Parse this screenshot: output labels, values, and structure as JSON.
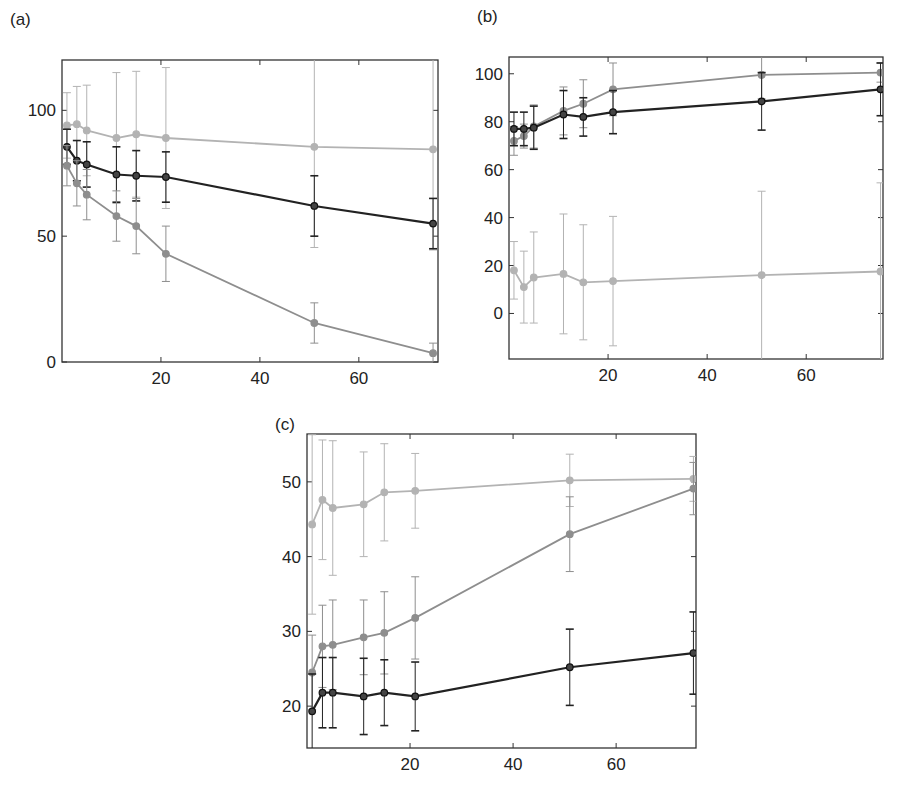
{
  "figure": {
    "panels": [
      "(a)",
      "(b)",
      "(c)"
    ]
  },
  "colors": {
    "light": "#b3b3b3",
    "medium": "#8e8e8e",
    "dark": "#222222",
    "axis": "#333333"
  },
  "chart_data": [
    {
      "id": "a",
      "type": "line",
      "title": "(a)",
      "xlabel": "",
      "ylabel": "",
      "xlim": [
        0,
        76
      ],
      "ylim": [
        0,
        120
      ],
      "xticks": [
        20,
        40,
        60
      ],
      "yticks": [
        0,
        50,
        100
      ],
      "grid": false,
      "legend": null,
      "x": [
        1,
        3,
        5,
        11,
        15,
        21,
        51,
        75
      ],
      "series": [
        {
          "name": "light-gray series",
          "color": "light",
          "values": [
            94,
            94.5,
            92,
            89,
            90.5,
            89,
            85.5,
            84.5
          ],
          "errors": [
            13,
            15,
            18,
            26,
            25,
            28,
            40,
            40
          ]
        },
        {
          "name": "black series",
          "color": "dark",
          "values": [
            85.5,
            80,
            78.5,
            74.5,
            74,
            73.5,
            62,
            55
          ],
          "errors": [
            7,
            8,
            9,
            11,
            10,
            10,
            12,
            10
          ]
        },
        {
          "name": "medium-gray series",
          "color": "medium",
          "values": [
            78,
            71,
            66.5,
            58,
            54,
            43,
            15.5,
            3.5
          ],
          "errors": [
            8,
            9,
            10,
            10,
            11,
            11,
            8,
            4
          ]
        }
      ]
    },
    {
      "id": "b",
      "type": "line",
      "title": "(b)",
      "xlabel": "",
      "ylabel": "",
      "xlim": [
        0,
        75.5
      ],
      "ylim": [
        -19,
        107
      ],
      "xticks": [
        20,
        40,
        60
      ],
      "yticks": [
        0,
        20,
        40,
        60,
        80,
        100
      ],
      "grid": false,
      "legend": null,
      "x": [
        1,
        3,
        5,
        11,
        15,
        21,
        51,
        75
      ],
      "series": [
        {
          "name": "medium-gray series",
          "color": "medium",
          "values": [
            72,
            74,
            78,
            84.5,
            87.5,
            93.5,
            99.5,
            100.5
          ],
          "errors": [
            6,
            5,
            9,
            10,
            10,
            11,
            10,
            4
          ]
        },
        {
          "name": "black series",
          "color": "dark",
          "values": [
            77,
            77,
            77.5,
            83,
            82,
            84,
            88.5,
            93.5
          ],
          "errors": [
            7,
            7,
            9,
            10,
            8,
            9,
            12,
            11
          ]
        },
        {
          "name": "light-gray series",
          "color": "light",
          "values": [
            18,
            11,
            15,
            16.5,
            13,
            13.5,
            16,
            17.5
          ],
          "errors": [
            12,
            15,
            19,
            25,
            24,
            27,
            35,
            37
          ]
        }
      ]
    },
    {
      "id": "c",
      "type": "line",
      "title": "(c)",
      "xlabel": "",
      "ylabel": "",
      "xlim": [
        0,
        75.5
      ],
      "ylim": [
        14.4,
        56.4
      ],
      "xticks": [
        20,
        40,
        60
      ],
      "yticks": [
        20,
        30,
        40,
        50
      ],
      "grid": false,
      "legend": null,
      "x": [
        1,
        3,
        5,
        11,
        15,
        21,
        51,
        75
      ],
      "series": [
        {
          "name": "light-gray series",
          "color": "light",
          "values": [
            44.3,
            47.6,
            46.5,
            47,
            48.6,
            48.8,
            50.2,
            50.4
          ],
          "errors": [
            12,
            8,
            9,
            7,
            6.5,
            5,
            3.5,
            3
          ]
        },
        {
          "name": "medium-gray series",
          "color": "medium",
          "values": [
            24.5,
            28,
            28.2,
            29.2,
            29.8,
            31.8,
            43,
            49.1
          ],
          "errors": [
            5,
            5.5,
            6,
            5,
            5.5,
            5.5,
            5,
            3.5
          ]
        },
        {
          "name": "black series",
          "color": "dark",
          "values": [
            19.3,
            21.8,
            21.8,
            21.3,
            21.8,
            21.3,
            25.2,
            27.1
          ],
          "errors": [
            5,
            4.7,
            4.7,
            5.1,
            4.4,
            4.6,
            5.1,
            5.5
          ]
        }
      ]
    }
  ]
}
